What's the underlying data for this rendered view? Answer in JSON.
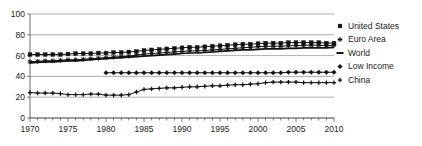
{
  "chart_data": {
    "type": "line",
    "title": "",
    "subtitle": "",
    "xlabel": "",
    "ylabel": "",
    "xlim": [
      1970,
      2010
    ],
    "ylim": [
      0,
      100
    ],
    "grid": true,
    "legend_position": "right",
    "y_ticks": [
      0,
      20,
      40,
      60,
      80,
      100
    ],
    "y_tick_labels": [
      "0",
      "20",
      "40",
      "60",
      "80",
      "100"
    ],
    "x_ticks": [
      1970,
      1975,
      1980,
      1985,
      1990,
      1995,
      2000,
      2005,
      2010
    ],
    "x_tick_labels": [
      "1970",
      "1975",
      "1980",
      "1985",
      "1990",
      "1995",
      "2000",
      "2005",
      "2010"
    ],
    "x_minor_tick_step": 1,
    "x": [
      1970,
      1971,
      1972,
      1973,
      1974,
      1975,
      1976,
      1977,
      1978,
      1979,
      1980,
      1981,
      1982,
      1983,
      1984,
      1985,
      1986,
      1987,
      1988,
      1989,
      1990,
      1991,
      1992,
      1993,
      1994,
      1995,
      1996,
      1997,
      1998,
      1999,
      2000,
      2001,
      2002,
      2003,
      2004,
      2005,
      2006,
      2007,
      2008,
      2009,
      2010
    ],
    "series": [
      {
        "name": "United States",
        "marker": "square",
        "color": "#111111",
        "x": [
          1970,
          1971,
          1972,
          1973,
          1974,
          1975,
          1976,
          1977,
          1978,
          1979,
          1980,
          1981,
          1982,
          1983,
          1984,
          1985,
          1986,
          1987,
          1988,
          1989,
          1990,
          1991,
          1992,
          1993,
          1994,
          1995,
          1996,
          1997,
          1998,
          1999,
          2000,
          2001,
          2002,
          2003,
          2004,
          2005,
          2006,
          2007,
          2008,
          2009,
          2010
        ],
        "values": [
          61,
          61,
          61,
          61,
          61,
          61.5,
          62,
          62,
          62,
          62.5,
          62.5,
          63,
          63,
          63.5,
          64,
          65,
          65.5,
          66,
          66.5,
          67,
          67.5,
          68,
          68,
          68.5,
          69,
          69.5,
          70,
          70.5,
          71,
          71,
          71.5,
          72,
          72,
          72,
          72.5,
          72.5,
          72.5,
          72.5,
          72.5,
          72,
          72
        ]
      },
      {
        "name": "Euro Area",
        "marker": "star",
        "color": "#111111",
        "x": [
          1970,
          1971,
          1972,
          1973,
          1974,
          1975,
          1976,
          1977,
          1978,
          1979,
          1980,
          1981,
          1982,
          1983,
          1984,
          1985,
          1986,
          1987,
          1988,
          1989,
          1990,
          1991,
          1992,
          1993,
          1994,
          1995,
          1996,
          1997,
          1998,
          1999,
          2000,
          2001,
          2002,
          2003,
          2004,
          2005,
          2006,
          2007,
          2008,
          2009,
          2010
        ],
        "values": [
          54,
          54.5,
          55,
          55,
          55.5,
          56,
          56,
          56.5,
          57,
          57.5,
          58,
          58.5,
          59,
          59.5,
          60.5,
          61.5,
          62,
          62.5,
          63,
          63.5,
          64,
          64.5,
          64.5,
          65,
          65.5,
          66,
          66.5,
          67,
          67.5,
          68,
          68.5,
          69,
          69,
          69,
          69.5,
          69.5,
          70,
          70,
          70,
          69.5,
          70
        ]
      },
      {
        "name": "World",
        "marker": "line",
        "color": "#111111",
        "x": [
          1970,
          1971,
          1972,
          1973,
          1974,
          1975,
          1976,
          1977,
          1978,
          1979,
          1980,
          1981,
          1982,
          1983,
          1984,
          1985,
          1986,
          1987,
          1988,
          1989,
          1990,
          1991,
          1992,
          1993,
          1994,
          1995,
          1996,
          1997,
          1998,
          1999,
          2000,
          2001,
          2002,
          2003,
          2004,
          2005,
          2006,
          2007,
          2008,
          2009,
          2010
        ],
        "values": [
          53,
          53.5,
          54,
          54,
          54.5,
          55,
          55,
          55.5,
          56,
          56.5,
          57,
          57.5,
          58,
          58.5,
          59,
          59.5,
          60,
          60.5,
          61,
          61.5,
          62,
          62.5,
          62.5,
          63,
          63.5,
          64,
          64.5,
          65,
          65.5,
          65.5,
          66,
          66.5,
          66.5,
          66.5,
          67,
          67,
          67.5,
          67.5,
          67.5,
          67.5,
          68
        ]
      },
      {
        "name": "Low Income",
        "marker": "diamond",
        "color": "#111111",
        "x": [
          1980,
          1981,
          1982,
          1983,
          1984,
          1985,
          1986,
          1987,
          1988,
          1989,
          1990,
          1991,
          1992,
          1993,
          1994,
          1995,
          1996,
          1997,
          1998,
          1999,
          2000,
          2001,
          2002,
          2003,
          2004,
          2005,
          2006,
          2007,
          2008,
          2009,
          2010
        ],
        "values": [
          43.5,
          43.5,
          43.5,
          43.5,
          43.5,
          43.5,
          43.5,
          43.5,
          43.5,
          43.5,
          43.5,
          43.5,
          43.5,
          43.5,
          43.5,
          43.5,
          43.5,
          43.5,
          43.5,
          43.5,
          43.5,
          43.5,
          43.5,
          43.5,
          44,
          44,
          44,
          44,
          44,
          44,
          44
        ]
      },
      {
        "name": "China",
        "marker": "plus",
        "color": "#111111",
        "x": [
          1970,
          1971,
          1972,
          1973,
          1974,
          1975,
          1976,
          1977,
          1978,
          1979,
          1980,
          1981,
          1982,
          1983,
          1984,
          1985,
          1986,
          1987,
          1988,
          1989,
          1990,
          1991,
          1992,
          1993,
          1994,
          1995,
          1996,
          1997,
          1998,
          1999,
          2000,
          2001,
          2002,
          2003,
          2004,
          2005,
          2006,
          2007,
          2008,
          2009,
          2010
        ],
        "values": [
          24.5,
          24,
          24,
          24,
          23.5,
          22.5,
          22.5,
          22.5,
          23,
          23,
          22,
          22,
          22,
          22.5,
          25,
          27.5,
          28,
          28.5,
          29,
          29,
          29.5,
          30,
          30,
          30.5,
          31,
          31,
          31.5,
          32,
          32,
          32.5,
          33,
          34,
          34.5,
          34.5,
          34.5,
          34.5,
          34,
          34,
          34,
          34,
          34
        ]
      }
    ]
  },
  "legend": {
    "items": [
      {
        "label": "United States",
        "marker": "square"
      },
      {
        "label": "Euro Area",
        "marker": "star"
      },
      {
        "label": "World",
        "marker": "line"
      },
      {
        "label": "Low Income",
        "marker": "diamond"
      },
      {
        "label": "China",
        "marker": "plus"
      }
    ]
  }
}
